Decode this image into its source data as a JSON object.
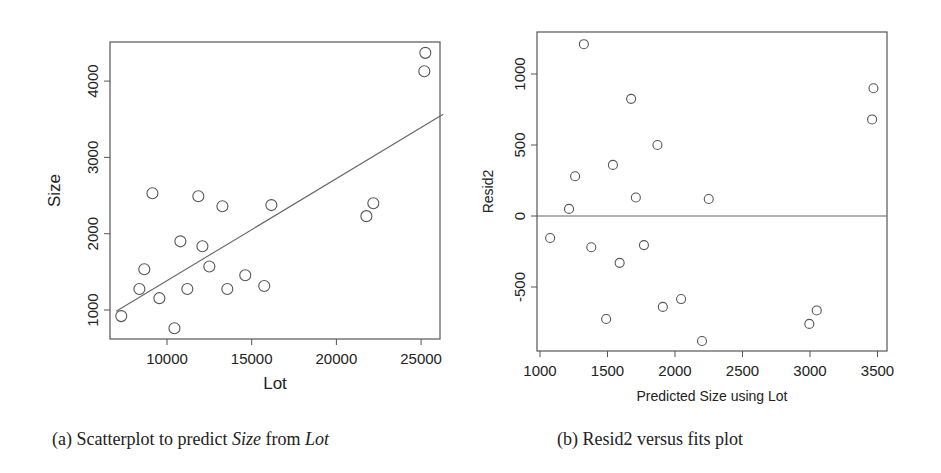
{
  "chart_data": [
    {
      "type": "scatter",
      "panel": "a",
      "title": "",
      "caption": "(a) Scatterplot to predict Size from Lot",
      "xlabel": "Lot",
      "ylabel": "Size",
      "xlim": [
        6300,
        26300
      ],
      "ylim": [
        600,
        4500
      ],
      "xticks": [
        10000,
        15000,
        20000,
        25000
      ],
      "yticks": [
        1000,
        2000,
        3000,
        4000
      ],
      "grid": false,
      "legend": null,
      "marker": "open-circle",
      "points": [
        {
          "x": 7300,
          "y": 920
        },
        {
          "x": 8370,
          "y": 1275
        },
        {
          "x": 8660,
          "y": 1535
        },
        {
          "x": 9140,
          "y": 2530
        },
        {
          "x": 9550,
          "y": 1155
        },
        {
          "x": 10440,
          "y": 760
        },
        {
          "x": 10790,
          "y": 1900
        },
        {
          "x": 11200,
          "y": 1275
        },
        {
          "x": 11850,
          "y": 2490
        },
        {
          "x": 12090,
          "y": 1835
        },
        {
          "x": 12500,
          "y": 1570
        },
        {
          "x": 13270,
          "y": 2360
        },
        {
          "x": 13560,
          "y": 1275
        },
        {
          "x": 14620,
          "y": 1455
        },
        {
          "x": 15740,
          "y": 1315
        },
        {
          "x": 16160,
          "y": 2375
        },
        {
          "x": 21770,
          "y": 2230
        },
        {
          "x": 22180,
          "y": 2400
        },
        {
          "x": 25190,
          "y": 4130
        },
        {
          "x": 25250,
          "y": 4370
        }
      ],
      "fit_line": {
        "x": [
          7000,
          26300
        ],
        "y": [
          983,
          3565
        ],
        "label": "least-squares line"
      }
    },
    {
      "type": "scatter",
      "panel": "b",
      "title": "",
      "caption": "(b) Resid2 versus fits plot",
      "xlabel": "Predicted Size using Lot",
      "ylabel": "Resid2",
      "xlim": [
        990,
        3570
      ],
      "ylim": [
        -950,
        1300
      ],
      "xticks": [
        1000,
        1500,
        2000,
        2500,
        3000,
        3500
      ],
      "yticks": [
        -500,
        0,
        500,
        1000
      ],
      "grid": false,
      "legend": null,
      "marker": "open-circle",
      "reference_line": {
        "y": 0
      },
      "points": [
        {
          "x": 1075,
          "y": -155
        },
        {
          "x": 1215,
          "y": 50
        },
        {
          "x": 1260,
          "y": 280
        },
        {
          "x": 1325,
          "y": 1210
        },
        {
          "x": 1380,
          "y": -220
        },
        {
          "x": 1490,
          "y": -725
        },
        {
          "x": 1540,
          "y": 360
        },
        {
          "x": 1590,
          "y": -330
        },
        {
          "x": 1675,
          "y": 825
        },
        {
          "x": 1710,
          "y": 130
        },
        {
          "x": 1770,
          "y": -205
        },
        {
          "x": 1870,
          "y": 500
        },
        {
          "x": 1910,
          "y": -640
        },
        {
          "x": 2045,
          "y": -585
        },
        {
          "x": 2200,
          "y": -880
        },
        {
          "x": 2250,
          "y": 120
        },
        {
          "x": 2995,
          "y": -760
        },
        {
          "x": 3050,
          "y": -665
        },
        {
          "x": 3460,
          "y": 680
        },
        {
          "x": 3470,
          "y": 900
        }
      ]
    }
  ],
  "panel_a": {
    "xlabel": "Lot",
    "ylabel": "Size",
    "xtick_labels": [
      "10000",
      "15000",
      "20000",
      "25000"
    ],
    "ytick_labels": [
      "1000",
      "2000",
      "3000",
      "4000"
    ],
    "caption_prefix": "(a) Scatterplot to predict ",
    "caption_var1": "Size",
    "caption_mid": " from ",
    "caption_var2": "Lot"
  },
  "panel_b": {
    "xlabel": "Predicted Size using Lot",
    "ylabel": "Resid2",
    "xtick_labels": [
      "1000",
      "1500",
      "2000",
      "2500",
      "3000",
      "3500"
    ],
    "ytick_labels": [
      "-500",
      "0",
      "500",
      "1000"
    ],
    "caption": "(b) Resid2 versus fits plot"
  },
  "colors": {
    "axis": "#555555",
    "marker": "#555555",
    "line": "#666666",
    "text": "#222222",
    "background": "#ffffff"
  }
}
